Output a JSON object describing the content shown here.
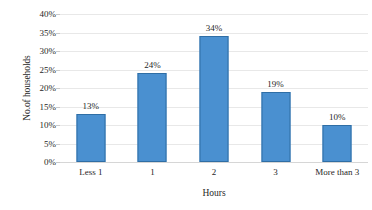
{
  "chart_data": {
    "type": "bar",
    "title": "",
    "subtitle": "",
    "categories": [
      "Less 1",
      "1",
      "2",
      "3",
      "More than 3"
    ],
    "values": [
      13,
      24,
      34,
      19,
      10
    ],
    "data_labels": [
      "13%",
      "24%",
      "34%",
      "19%",
      "10%"
    ],
    "xlabel": "Hours",
    "ylabel": "No.of households",
    "ylim": [
      0,
      40
    ],
    "ytick_step": 5,
    "ytick_labels": [
      "0%",
      "5%",
      "10%",
      "15%",
      "20%",
      "25%",
      "30%",
      "35%",
      "40%"
    ],
    "ytick_values": [
      0,
      5,
      10,
      15,
      20,
      25,
      30,
      35,
      40
    ],
    "value_format": "percent",
    "grid": {
      "horizontal": true,
      "vertical": false,
      "color": "#e8e8e8"
    },
    "legend": {
      "visible": false,
      "position": "none",
      "entries": []
    },
    "series": [
      {
        "name": "No.of households",
        "values": [
          13,
          24,
          34,
          19,
          10
        ],
        "bar_fill": "#4a90d0",
        "bar_border": "#2f6ea5"
      }
    ],
    "annotations": []
  }
}
